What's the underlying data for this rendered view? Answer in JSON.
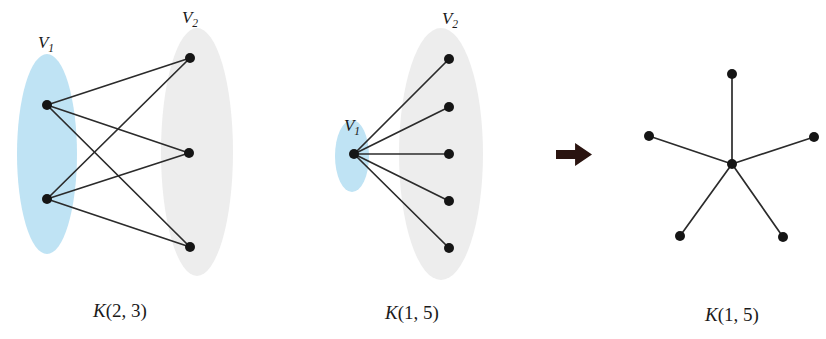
{
  "figure": {
    "background_color": "#ffffff",
    "blue_fill": "#bfe3f4",
    "gray_fill": "#ededed",
    "node_color": "#151515",
    "edge_color": "#2b2b2b",
    "arrow_color": "#2a1410"
  },
  "panels": [
    {
      "id": "panel-k23",
      "caption": "K(2, 3)",
      "caption_pos": {
        "x": 120,
        "y": 317
      },
      "graph_type": "complete-bipartite",
      "parts": [
        {
          "name": "V1",
          "label_text": "V",
          "label_sub": "1",
          "label_pos": {
            "x": 46,
            "y": 48
          },
          "blob": {
            "cx": 47,
            "cy": 154,
            "rx": 30,
            "ry": 100,
            "fill": "#bfe3f4"
          },
          "vertices": [
            {
              "x": 47,
              "y": 105
            },
            {
              "x": 47,
              "y": 199
            }
          ]
        },
        {
          "name": "V2",
          "label_text": "V",
          "label_sub": "2",
          "label_pos": {
            "x": 190,
            "y": 23
          },
          "blob": {
            "cx": 197,
            "cy": 152,
            "rx": 36,
            "ry": 124,
            "fill": "#ededed"
          },
          "vertices": [
            {
              "x": 190,
              "y": 58
            },
            {
              "x": 189,
              "y": 153
            },
            {
              "x": 190,
              "y": 247
            }
          ]
        }
      ],
      "edges": [
        {
          "from": [
            47,
            105
          ],
          "to": [
            190,
            58
          ]
        },
        {
          "from": [
            47,
            105
          ],
          "to": [
            189,
            153
          ]
        },
        {
          "from": [
            47,
            105
          ],
          "to": [
            190,
            247
          ]
        },
        {
          "from": [
            47,
            199
          ],
          "to": [
            190,
            58
          ]
        },
        {
          "from": [
            47,
            199
          ],
          "to": [
            189,
            153
          ]
        },
        {
          "from": [
            47,
            199
          ],
          "to": [
            190,
            247
          ]
        }
      ]
    },
    {
      "id": "panel-k15-bipartite",
      "caption": "K(1, 5)",
      "caption_pos": {
        "x": 412,
        "y": 319
      },
      "graph_type": "complete-bipartite",
      "parts": [
        {
          "name": "V1",
          "label_text": "V",
          "label_sub": "1",
          "label_pos": {
            "x": 352,
            "y": 131
          },
          "blob": {
            "cx": 352,
            "cy": 156,
            "rx": 17,
            "ry": 36,
            "fill": "#bfe3f4"
          },
          "vertices": [
            {
              "x": 354,
              "y": 154
            }
          ]
        },
        {
          "name": "V2",
          "label_text": "V",
          "label_sub": "2",
          "label_pos": {
            "x": 450,
            "y": 24
          },
          "blob": {
            "cx": 441,
            "cy": 154,
            "rx": 42,
            "ry": 126,
            "fill": "#ededed"
          },
          "vertices": [
            {
              "x": 449,
              "y": 59
            },
            {
              "x": 449,
              "y": 107
            },
            {
              "x": 449,
              "y": 154
            },
            {
              "x": 449,
              "y": 201
            },
            {
              "x": 449,
              "y": 248
            }
          ]
        }
      ],
      "edges": [
        {
          "from": [
            354,
            154
          ],
          "to": [
            449,
            59
          ]
        },
        {
          "from": [
            354,
            154
          ],
          "to": [
            449,
            107
          ]
        },
        {
          "from": [
            354,
            154
          ],
          "to": [
            449,
            154
          ]
        },
        {
          "from": [
            354,
            154
          ],
          "to": [
            449,
            201
          ]
        },
        {
          "from": [
            354,
            154
          ],
          "to": [
            449,
            248
          ]
        }
      ]
    },
    {
      "id": "panel-k15-star",
      "caption": "K(1, 5)",
      "caption_pos": {
        "x": 732,
        "y": 321
      },
      "graph_type": "star",
      "parts": [
        {
          "name": "star",
          "label_text": "",
          "label_sub": "",
          "label_pos": null,
          "blob": null,
          "vertices": [
            {
              "x": 732,
              "y": 164
            },
            {
              "x": 732,
              "y": 74
            },
            {
              "x": 649,
              "y": 136
            },
            {
              "x": 814,
              "y": 137
            },
            {
              "x": 680,
              "y": 236
            },
            {
              "x": 783,
              "y": 237
            }
          ]
        }
      ],
      "edges": [
        {
          "from": [
            732,
            164
          ],
          "to": [
            732,
            74
          ]
        },
        {
          "from": [
            732,
            164
          ],
          "to": [
            649,
            136
          ]
        },
        {
          "from": [
            732,
            164
          ],
          "to": [
            814,
            137
          ]
        },
        {
          "from": [
            732,
            164
          ],
          "to": [
            680,
            236
          ]
        },
        {
          "from": [
            732,
            164
          ],
          "to": [
            783,
            237
          ]
        }
      ]
    }
  ],
  "arrow": {
    "name": "right-arrow",
    "x": 556,
    "y": 143,
    "width": 36,
    "height": 23,
    "color": "#2a1410"
  }
}
